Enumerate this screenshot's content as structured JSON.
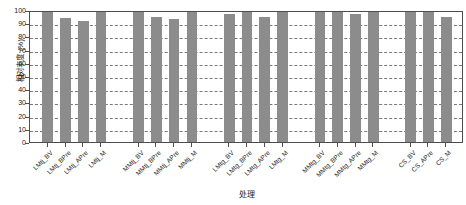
{
  "chart_data": {
    "type": "bar",
    "title": "",
    "xlabel": "处理",
    "ylabel": "相对丰度 (%)",
    "ylim": [
      0,
      100
    ],
    "yticks": [
      0,
      10,
      20,
      30,
      40,
      50,
      60,
      70,
      80,
      90,
      100
    ],
    "ytick_labels": [
      "0",
      "10",
      "20",
      "30",
      "40",
      "50",
      "60",
      "70",
      "80",
      "90",
      "100"
    ],
    "grid": true,
    "legend": "none",
    "bar_color": "#8c8c8c",
    "groups": [
      {
        "name": "LMtj",
        "categories": [
          "LMtj_BV",
          "LMtj_BPre",
          "LMtj_APre",
          "LMtj_M"
        ],
        "values": [
          100,
          94,
          92,
          100
        ]
      },
      {
        "name": "MMtj",
        "categories": [
          "MMtj_BV",
          "MMtj_BPre",
          "MMtj_APre",
          "MMtj_M"
        ],
        "values": [
          100,
          95,
          93,
          100
        ]
      },
      {
        "name": "LMtg",
        "categories": [
          "LMtg_BV",
          "LMtg_BPre",
          "LMtg_APre",
          "LMtg_M"
        ],
        "values": [
          97,
          100,
          95,
          100
        ]
      },
      {
        "name": "MMtg",
        "categories": [
          "MMtg_BV",
          "MMtg_BPre",
          "MMtg_APre",
          "MMtg_M"
        ],
        "values": [
          100,
          100,
          97,
          100
        ]
      },
      {
        "name": "CS",
        "categories": [
          "CS_BV",
          "CS_APre",
          "CS_M"
        ],
        "values": [
          100,
          100,
          95
        ]
      }
    ],
    "categories": [
      "LMtj_BV",
      "LMtj_BPre",
      "LMtj_APre",
      "LMtj_M",
      "MMtj_BV",
      "MMtj_BPre",
      "MMtj_APre",
      "MMtj_M",
      "LMtg_BV",
      "LMtg_BPre",
      "LMtg_APre",
      "LMtg_M",
      "MMtg_BV",
      "MMtg_BPre",
      "MMtg_APre",
      "MMtg_M",
      "CS_BV",
      "CS_APre",
      "CS_M"
    ],
    "values": [
      100,
      94,
      92,
      100,
      100,
      95,
      93,
      100,
      97,
      100,
      95,
      100,
      100,
      100,
      97,
      100,
      100,
      100,
      95
    ]
  }
}
